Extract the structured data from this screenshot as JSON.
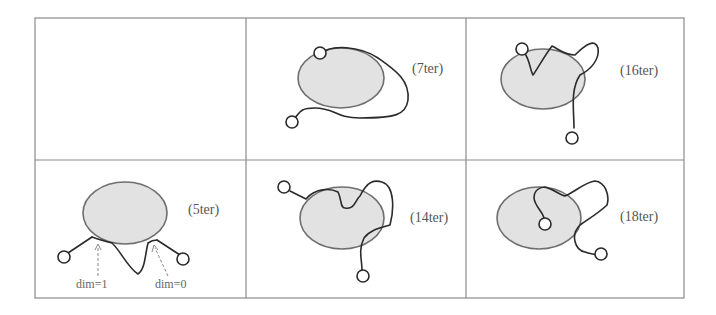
{
  "figure": {
    "cells": [
      {
        "id": "empty",
        "label": ""
      },
      {
        "id": "7ter",
        "label": "(7ter)"
      },
      {
        "id": "16ter",
        "label": "(16ter)"
      },
      {
        "id": "5ter",
        "label": "(5ter)",
        "annotations": [
          "dim=1",
          "dim=0"
        ]
      },
      {
        "id": "14ter",
        "label": "(14ter)"
      },
      {
        "id": "18ter",
        "label": "(18ter)"
      }
    ]
  },
  "colors": {
    "disk_fill": "#e2e2e2",
    "disk_stroke": "#6e6e6e",
    "curve": "#2a2a2a",
    "grid": "#8a8a8a",
    "text": "#555555"
  }
}
